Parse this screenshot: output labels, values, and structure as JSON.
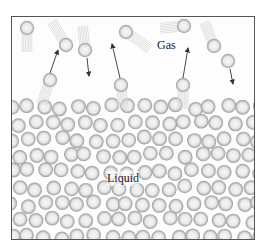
{
  "figure": {
    "title": "",
    "labels": {
      "gas": "Gas",
      "liquid": "Liquid"
    },
    "colors": {
      "border": "#555555",
      "molecule_edge": "#9a9a9a",
      "molecule_fill": "#e6e6e6",
      "arrow": "#333333"
    }
  },
  "gas_molecules": [
    {
      "x": 27,
      "y": 28,
      "trail": [
        0,
        1
      ]
    },
    {
      "x": 66,
      "y": 45,
      "trail": [
        -0.6,
        -1
      ]
    },
    {
      "x": 85,
      "y": 50,
      "trail": [
        -0.1,
        -1
      ]
    },
    {
      "x": 126,
      "y": 32,
      "trail": [
        1,
        0.7
      ]
    },
    {
      "x": 50,
      "y": 80,
      "trail": [
        -0.35,
        1
      ]
    },
    {
      "x": 121,
      "y": 85,
      "trail": [
        0.1,
        1
      ]
    },
    {
      "x": 184,
      "y": 26,
      "trail": [
        -1,
        0.1
      ]
    },
    {
      "x": 214,
      "y": 46,
      "trail": [
        -0.4,
        -1
      ]
    },
    {
      "x": 228,
      "y": 61,
      "trail": null
    },
    {
      "x": 183,
      "y": 85,
      "trail": [
        0,
        1
      ]
    }
  ],
  "arrows": [
    {
      "x1": 50,
      "y1": 73,
      "x2": 58,
      "y2": 50
    },
    {
      "x1": 87,
      "y1": 58,
      "x2": 89,
      "y2": 76
    },
    {
      "x1": 120,
      "y1": 78,
      "x2": 112,
      "y2": 44
    },
    {
      "x1": 183,
      "y1": 78,
      "x2": 188,
      "y2": 48
    },
    {
      "x1": 230,
      "y1": 69,
      "x2": 233,
      "y2": 84
    }
  ]
}
